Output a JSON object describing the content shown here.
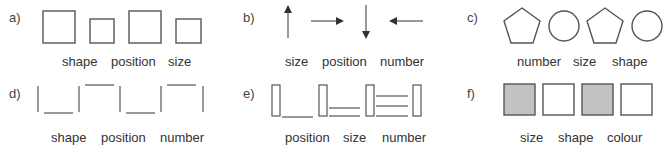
{
  "panels": {
    "a": {
      "letter": "a)",
      "labels": [
        "shape",
        "position",
        "size"
      ]
    },
    "b": {
      "letter": "b)",
      "labels": [
        "size",
        "position",
        "number"
      ]
    },
    "c": {
      "letter": "c)",
      "labels": [
        "number",
        "size",
        "shape"
      ]
    },
    "d": {
      "letter": "d)",
      "labels": [
        "shape",
        "position",
        "number"
      ]
    },
    "e": {
      "letter": "e)",
      "labels": [
        "position",
        "size",
        "number"
      ]
    },
    "f": {
      "letter": "f)",
      "labels": [
        "size",
        "shape",
        "colour"
      ]
    }
  },
  "colors": {
    "stroke": "#555555",
    "fill_gray": "#c2c2c2",
    "background": "#ffffff"
  }
}
